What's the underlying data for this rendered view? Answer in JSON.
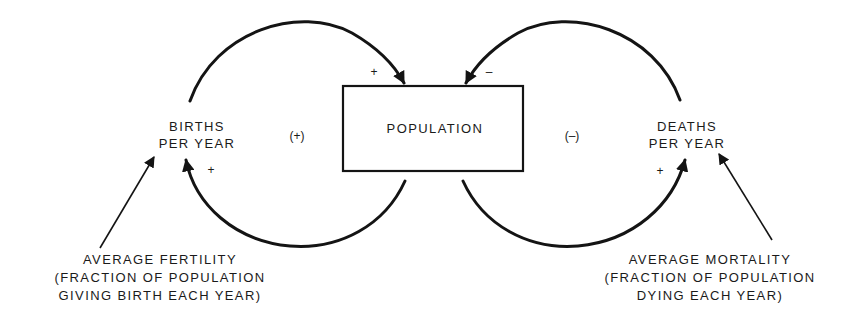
{
  "diagram": {
    "stock": {
      "label": "POPULATION"
    },
    "births": {
      "line1": "BIRTHS",
      "line2": "PER YEAR"
    },
    "deaths": {
      "line1": "DEATHS",
      "line2": "PER YEAR"
    },
    "loops": {
      "births_loop_polarity": "(+)",
      "deaths_loop_polarity": "(–)"
    },
    "link_signs": {
      "births_to_population": "+",
      "population_to_births": "+",
      "deaths_to_population": "–",
      "population_to_deaths": "+"
    },
    "fertility": {
      "line1": "AVERAGE FERTILITY",
      "line2": "(FRACTION OF POPULATION",
      "line3": "GIVING BIRTH EACH YEAR)"
    },
    "mortality": {
      "line1": "AVERAGE MORTALITY",
      "line2": "(FRACTION OF POPULATION",
      "line3": "DYING EACH YEAR)"
    },
    "colors": {
      "ink": "#141414",
      "background": "#ffffff"
    }
  }
}
